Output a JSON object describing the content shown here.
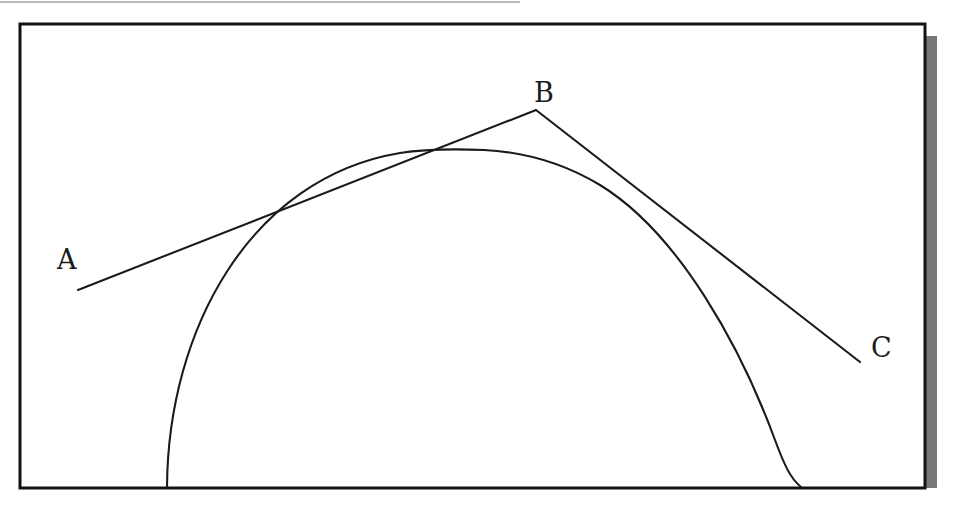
{
  "figure": {
    "background_color": "#ffffff",
    "ink_color": "#1b1b1b",
    "frame": {
      "name": "drawing-frame",
      "border_color": "#121212",
      "shadow_color": "#77777a",
      "top_rule_color": "#b9b9bd",
      "x": 20,
      "y": 24,
      "width": 905,
      "height": 464,
      "shadow_offset": 12
    },
    "labels": [
      {
        "id": "A",
        "text": "A",
        "x": 57,
        "y": 246
      },
      {
        "id": "B",
        "text": "B",
        "x": 534,
        "y": 79
      },
      {
        "id": "C",
        "text": "C",
        "x": 871,
        "y": 334
      }
    ],
    "points": {
      "A": {
        "x": 78,
        "y": 290
      },
      "B": {
        "x": 536,
        "y": 110
      },
      "C": {
        "x": 860,
        "y": 362
      },
      "tangent_AB": {
        "x": 333,
        "y": 189
      },
      "tangent_BC": {
        "x": 695,
        "y": 230
      }
    },
    "arc": {
      "name": "circular-arc",
      "left_end": {
        "x": 167,
        "y": 487
      },
      "right_end": {
        "x": 801,
        "y": 487
      },
      "apex": {
        "x": 484,
        "y": 150
      },
      "stroke_width": 2
    },
    "segments": [
      {
        "id": "AB",
        "from": "A",
        "to": "B",
        "stroke_width": 2
      },
      {
        "id": "BC",
        "from": "B",
        "to": "C",
        "stroke_width": 2
      }
    ]
  }
}
